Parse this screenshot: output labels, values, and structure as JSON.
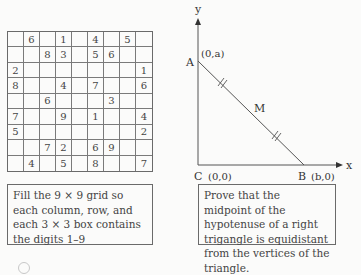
{
  "sudoku": {
    "grid": [
      [
        "",
        "6",
        "",
        "1",
        "",
        "4",
        "",
        "5",
        ""
      ],
      [
        "",
        "",
        "8",
        "3",
        "",
        "5",
        "6",
        "",
        ""
      ],
      [
        "2",
        "",
        "",
        "",
        "",
        "",
        "",
        "",
        "1"
      ],
      [
        "8",
        "",
        "",
        "4",
        "",
        "7",
        "",
        "",
        "6"
      ],
      [
        "",
        "",
        "6",
        "",
        "",
        "",
        "3",
        "",
        ""
      ],
      [
        "7",
        "",
        "",
        "9",
        "",
        "1",
        "",
        "",
        "4"
      ],
      [
        "5",
        "",
        "",
        "",
        "",
        "",
        "",
        "",
        "2"
      ],
      [
        "",
        "",
        "7",
        "2",
        "",
        "6",
        "9",
        "",
        ""
      ],
      [
        "",
        "4",
        "",
        "5",
        "",
        "8",
        "",
        "",
        "7"
      ]
    ],
    "caption": "Fill the 9 × 9 grid so each column, row, and each 3 × 3 box contains the digits 1–9"
  },
  "geometry": {
    "y_axis_label": "y",
    "x_axis_label": "x",
    "point_a_label": "A",
    "point_a_coord": "(0,a)",
    "point_b_label": "B",
    "point_b_coord": "(b,0)",
    "point_c_label": "C",
    "point_c_coord": "(0,0)",
    "midpoint_label": "M",
    "caption": "Prove that the midpoint of the hypotenuse of a right trigangle is equidistant from the vertices of the triangle."
  }
}
